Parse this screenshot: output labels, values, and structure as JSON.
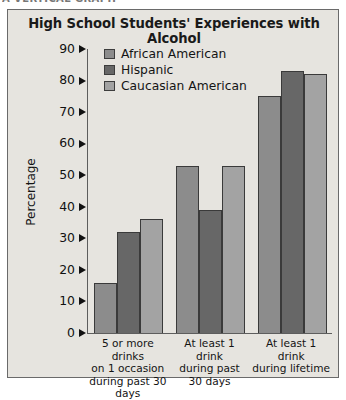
{
  "top_caption": "A VERTICAL GRAPH",
  "figure": {
    "title": "High School Students' Experiences with Alcohol"
  },
  "legend": {
    "items": [
      {
        "label": "African American",
        "color": "#8c8c8c",
        "icon": "legend-swatch-icon"
      },
      {
        "label": "Hispanic",
        "color": "#676767",
        "icon": "legend-swatch-icon"
      },
      {
        "label": "Caucasian American",
        "color": "#a3a3a3",
        "icon": "legend-swatch-icon"
      }
    ]
  },
  "axes": {
    "y_title": "Percentage",
    "y_ticks": [
      "90",
      "80",
      "70",
      "60",
      "50",
      "40",
      "30",
      "20",
      "10",
      "0"
    ]
  },
  "chart_data": {
    "type": "bar",
    "title": "High School Students' Experiences with Alcohol",
    "xlabel": "",
    "ylabel": "Percentage",
    "ylim": [
      0,
      90
    ],
    "ytick_step": 10,
    "grid": false,
    "legend_position": "top-center",
    "categories": [
      "5 or more drinks on 1 occasion during past 30 days",
      "At least 1 drink during past 30 days",
      "At least 1 drink during lifetime"
    ],
    "category_lines": [
      [
        "5 or more drinks",
        "on 1 occasion",
        "during past 30 days"
      ],
      [
        "At least 1 drink",
        "during past",
        "30 days"
      ],
      [
        "At least 1 drink",
        "during lifetime"
      ]
    ],
    "series": [
      {
        "name": "African American",
        "color": "#8c8c8c",
        "values": [
          16,
          53,
          75
        ]
      },
      {
        "name": "Hispanic",
        "color": "#676767",
        "values": [
          32,
          39,
          83
        ]
      },
      {
        "name": "Caucasian American",
        "color": "#a3a3a3",
        "values": [
          36,
          53,
          82
        ]
      }
    ]
  }
}
